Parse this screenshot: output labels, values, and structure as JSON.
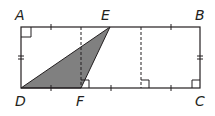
{
  "diagram": {
    "type": "geometry",
    "labels": {
      "A": "A",
      "B": "B",
      "C": "C",
      "D": "D",
      "E": "E",
      "F": "F"
    },
    "colors": {
      "stroke": "#231f20",
      "shade": "#808080",
      "background": "#ffffff"
    },
    "elements": {
      "rectangle": "ABCD",
      "shaded_triangle": "DEF",
      "dashed_lines": 2,
      "right_angle_marks": [
        "A",
        "F",
        "C",
        "dashed-foot"
      ],
      "tick_marks_equal_segments": "top and bottom sides divided into 6 equal parts",
      "double_ticks": "AD and BC congruent"
    }
  }
}
